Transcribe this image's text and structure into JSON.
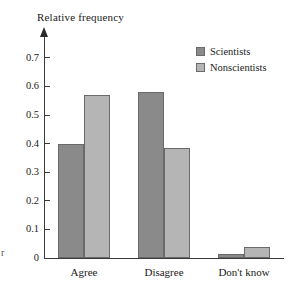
{
  "chart_data": {
    "type": "bar",
    "title": "",
    "subtitle": "",
    "xlabel": "",
    "ylabel": "Relative frequency",
    "categories": [
      "Agree",
      "Disagree",
      "Don't know"
    ],
    "series": [
      {
        "name": "Scientists",
        "color": "#8a8a8a",
        "values": [
          0.4,
          0.58,
          0.015
        ]
      },
      {
        "name": "Nonscientists",
        "color": "#b5b5b5",
        "values": [
          0.57,
          0.385,
          0.04
        ]
      }
    ],
    "ylim": [
      0,
      0.75
    ],
    "ytick_labels": [
      "0",
      "0.1",
      "0.2",
      "0.3",
      "0.4",
      "0.5",
      "0.6",
      "0.7"
    ],
    "ytick_values": [
      0,
      0.1,
      0.2,
      0.3,
      0.4,
      0.5,
      0.6,
      0.7
    ],
    "grid": false,
    "legend_position": "top-right",
    "axis_arrow": true
  },
  "legend": {
    "entries": [
      {
        "label": "Scientists"
      },
      {
        "label": "Nonscientists"
      }
    ]
  },
  "margin_note": "r"
}
